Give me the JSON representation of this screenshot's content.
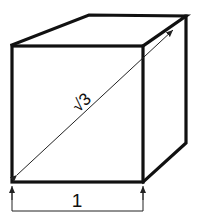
{
  "diagram": {
    "type": "cube-dimension-drawing",
    "edge_label": "1",
    "diagonal_label": "√3",
    "colors": {
      "line": "#111111",
      "background": "#ffffff"
    }
  }
}
